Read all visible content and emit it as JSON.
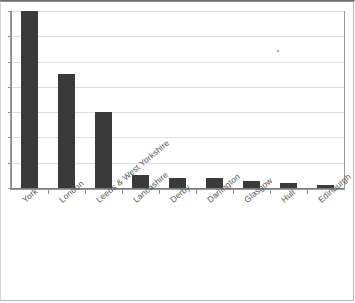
{
  "chart_data": {
    "type": "bar",
    "title": "",
    "subtitle": "",
    "xlabel": "",
    "ylabel": "",
    "categories": [
      "York",
      "London",
      "Leeds & West Yorkshire",
      "Lancashire",
      "Derby",
      "Darlington",
      "Glasgow",
      "Hull",
      "Edinburgh"
    ],
    "values": [
      7.0,
      4.5,
      3.0,
      0.5,
      0.38,
      0.38,
      0.28,
      0.2,
      0.1
    ],
    "ylim": [
      0,
      7
    ],
    "y_tick_values": [
      0,
      1,
      2,
      3,
      4,
      5,
      6,
      7
    ],
    "y_tick_labels": [
      "",
      "",
      "",
      "",
      "",
      "",
      "",
      ""
    ],
    "grid": true,
    "grid_axis": "y",
    "legend": false,
    "legend_position": "none",
    "bar_color": "#3a3a3a",
    "gridline_color": "#dedede",
    "axis_color": "#8d8d8d",
    "label_rotation_deg": -40,
    "label_color": "#575757"
  },
  "figure": {
    "frame_border_color": "#9a9a9a",
    "page_border_color": "#b9b9b9",
    "background": "#ffffff",
    "artifact": "scan-speckle"
  }
}
